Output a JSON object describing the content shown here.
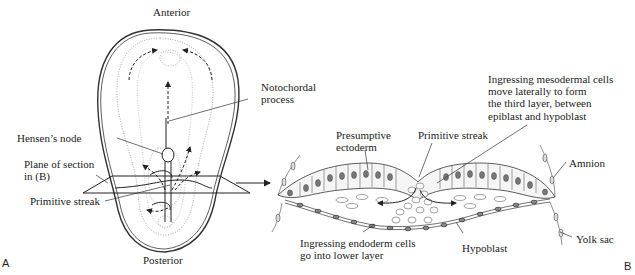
{
  "figure": {
    "panel_a": {
      "letter": "A",
      "labels": {
        "anterior": "Anterior",
        "posterior": "Posterior",
        "notochordal_1": "Notochordal",
        "notochordal_2": "process",
        "hensens_node": "Hensen’s node",
        "plane_1": "Plane of section",
        "plane_2": "in (B)",
        "primitive_streak": "Primitive streak"
      }
    },
    "panel_b": {
      "letter": "B",
      "labels": {
        "mesoderm_1": "Ingressing mesodermal cells",
        "mesoderm_2": "move laterally to form",
        "mesoderm_3": "the third layer, between",
        "mesoderm_4": "epiblast and hypoblast",
        "presumptive_1": "Presumptive",
        "presumptive_2": "ectoderm",
        "primitive_streak": "Primitive streak",
        "amnion": "Amnion",
        "endoderm_1": "Ingressing endoderm cells",
        "endoderm_2": "go into lower layer",
        "hypoblast": "Hypoblast",
        "yolk_sac": "Yolk sac"
      }
    }
  }
}
